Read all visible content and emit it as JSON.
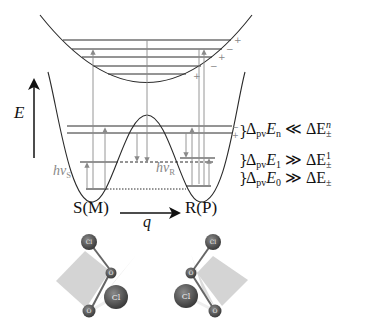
{
  "diagram": {
    "type": "energy-level diagram (double-well potential with excited state)",
    "axis": {
      "energy_label": "E",
      "coordinate_label": "q"
    },
    "wells": {
      "left_label": "S(M)",
      "right_label": "R(P)"
    },
    "photon_labels": {
      "left": {
        "base": "hν",
        "sub": "S"
      },
      "right": {
        "base": "hν",
        "sub": "R"
      }
    },
    "parity_signs": [
      "+",
      "−",
      "+",
      "−",
      "+"
    ],
    "tunnel_split_signs": [
      "−",
      "+"
    ],
    "relations": [
      {
        "lhs_base": "Δ",
        "lhs_sub": "pv",
        "lhs_var": "E",
        "lhs_var_sub": "n",
        "op": "≪",
        "rhs_base": "ΔE",
        "rhs_sub": "±",
        "rhs_sup": "n"
      },
      {
        "lhs_base": "Δ",
        "lhs_sub": "pv",
        "lhs_var": "E",
        "lhs_var_sub": "1",
        "op": "≫",
        "rhs_base": "ΔE",
        "rhs_sub": "±",
        "rhs_sup": "1"
      },
      {
        "lhs_base": "Δ",
        "lhs_sub": "pv",
        "lhs_var": "E",
        "lhs_var_sub": "0",
        "op": "≫",
        "rhs_base": "ΔE",
        "rhs_sub": "±",
        "rhs_sup": ""
      }
    ],
    "molecules": {
      "left": {
        "atoms": [
          "Cl",
          "O",
          "Cl",
          "O"
        ]
      },
      "right": {
        "atoms": [
          "Cl",
          "O",
          "Cl",
          "O"
        ]
      }
    },
    "colors": {
      "line": "#2a2a2a",
      "arrow_gray": "#8a8a8a",
      "atom": "#555555",
      "plane": "#d4d4d4"
    }
  }
}
